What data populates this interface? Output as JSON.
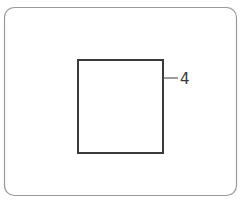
{
  "drawing": {
    "title": "Technical line drawing",
    "background_color": "#ffffff",
    "outer_frame": {
      "name": "outer-frame",
      "shape": "rounded-rectangle",
      "x": 4.5,
      "y": 7.5,
      "width": 232,
      "height": 188,
      "corner_radius": 10,
      "stroke_color": "#9a9a9a",
      "stroke_width": 1.2,
      "fill": "none"
    },
    "inner_square": {
      "name": "inner-square",
      "shape": "rectangle",
      "x": 78,
      "y": 60,
      "width": 85,
      "height": 93,
      "stroke_color": "#3a3a3a",
      "stroke_width": 2,
      "fill": "none"
    },
    "leader_line": {
      "name": "leader-line",
      "x1": 163,
      "y1": 78,
      "x2": 178,
      "y2": 78,
      "stroke_color": "#5a5a5a",
      "stroke_width": 1.2
    },
    "callout_label": {
      "name": "callout-label-4",
      "text": "4",
      "x": 180,
      "y": 84,
      "color": "#3a3a3a",
      "font_size": 15,
      "style": "hand-drawn-open-top"
    }
  }
}
